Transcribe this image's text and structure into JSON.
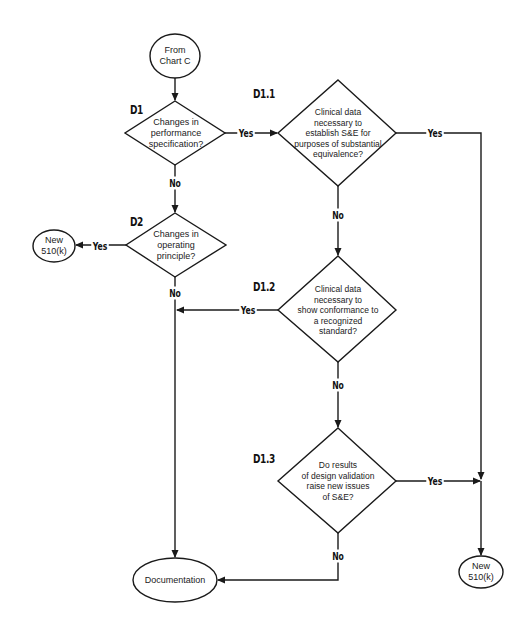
{
  "diagram": {
    "type": "flowchart",
    "colors": {
      "stroke": "#1a1a1a",
      "background": "#ffffff",
      "text": "#222222"
    },
    "nodes": {
      "start": {
        "shape": "ellipse",
        "text": "From\nChart C"
      },
      "d1": {
        "shape": "diamond",
        "id_label": "D1",
        "text": "Changes in\nperformance\nspecification?"
      },
      "d1_1": {
        "shape": "diamond",
        "id_label": "D1.1",
        "text": "Clinical data\nnecessary to\nestablish S&E for\npurposes of substantial\nequivalence?"
      },
      "d2": {
        "shape": "diamond",
        "id_label": "D2",
        "text": "Changes in\noperating\nprinciple?"
      },
      "new510k_left": {
        "shape": "ellipse",
        "text": "New\n510(k)"
      },
      "d1_2": {
        "shape": "diamond",
        "id_label": "D1.2",
        "text": "Clinical data\nnecessary to\nshow conformance to\na recognized\nstandard?"
      },
      "d1_3": {
        "shape": "diamond",
        "id_label": "D1.3",
        "text": "Do results\nof design validation\nraise new issues\nof S&E?"
      },
      "documentation": {
        "shape": "ellipse",
        "text": "Documentation"
      },
      "new510k_right": {
        "shape": "ellipse",
        "text": "New\n510(k)"
      }
    },
    "edges": {
      "d1_yes": "Yes",
      "d1_no": "No",
      "d1_1_yes": "Yes",
      "d1_1_no": "No",
      "d2_yes": "Yes",
      "d2_no": "No",
      "d1_2_yes": "Yes",
      "d1_2_no": "No",
      "d1_3_yes": "Yes",
      "d1_3_no": "No"
    }
  }
}
